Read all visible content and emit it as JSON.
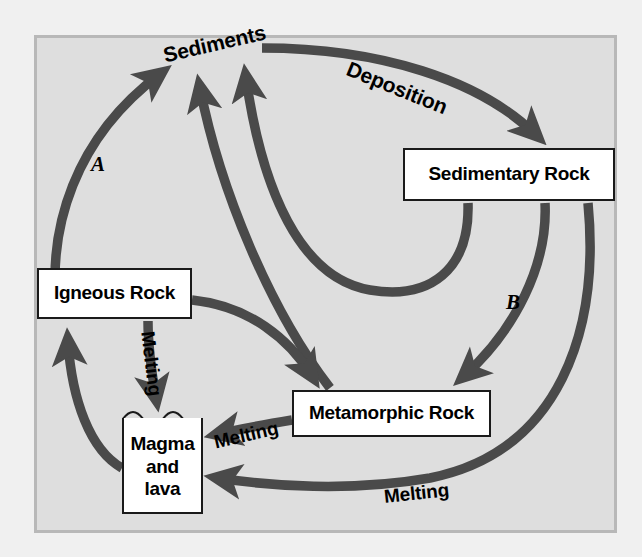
{
  "diagram": {
    "background_color": "#dedede",
    "frame_color": "#b8b8b8",
    "arrow_color": "#4a4a4a",
    "box_fill": "#ffffff",
    "box_border": "#1a1a1a",
    "text_color": "#000000"
  },
  "nodes": {
    "sedimentary_rock": "Sedimentary Rock",
    "igneous_rock": "Igneous Rock",
    "metamorphic_rock": "Metamorphic Rock",
    "magma_line1": "Magma",
    "magma_line2": "and",
    "magma_line3": "lava",
    "sediments": "Sediments"
  },
  "labels": {
    "deposition": "Deposition",
    "melting_igneous": "Melting",
    "melting_metamorphic": "Melting",
    "melting_sedimentary": "Melting",
    "process_a": "A",
    "process_b": "B"
  },
  "arrows": [
    {
      "name": "magma-to-sediments-A",
      "from": "Magma and lava",
      "to": "Sediments",
      "label": "A"
    },
    {
      "name": "sediments-to-sedimentary-rock",
      "from": "Sediments",
      "to": "Sedimentary Rock",
      "label": "Deposition"
    },
    {
      "name": "sedimentary-rock-to-sediments",
      "from": "Sedimentary Rock",
      "to": "Sediments",
      "label": ""
    },
    {
      "name": "metamorphic-rock-to-sediments",
      "from": "Metamorphic Rock",
      "to": "Sediments",
      "label": ""
    },
    {
      "name": "sedimentary-rock-to-metamorphic-rock-B",
      "from": "Sedimentary Rock",
      "to": "Metamorphic Rock",
      "label": "B"
    },
    {
      "name": "igneous-rock-to-metamorphic-rock",
      "from": "Igneous Rock",
      "to": "Metamorphic Rock",
      "label": ""
    },
    {
      "name": "igneous-rock-to-magma",
      "from": "Igneous Rock",
      "to": "Magma and lava",
      "label": "Melting"
    },
    {
      "name": "magma-to-igneous-rock",
      "from": "Magma and lava",
      "to": "Igneous Rock",
      "label": ""
    },
    {
      "name": "metamorphic-rock-to-magma",
      "from": "Metamorphic Rock",
      "to": "Magma and lava",
      "label": "Melting"
    },
    {
      "name": "sedimentary-rock-to-magma",
      "from": "Sedimentary Rock",
      "to": "Magma and lava",
      "label": "Melting"
    }
  ]
}
